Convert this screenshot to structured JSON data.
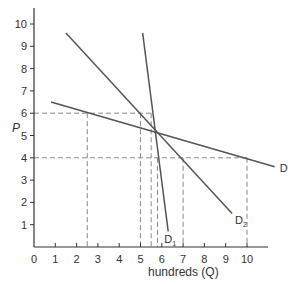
{
  "chart_data": {
    "type": "line",
    "title": "",
    "xlabel": "hundreds (Q)",
    "ylabel": "P",
    "xlim": [
      0,
      11
    ],
    "ylim": [
      0,
      11
    ],
    "x_ticks": [
      "0",
      "1",
      "2",
      "3",
      "4",
      "5",
      "6",
      "7",
      "8",
      "9",
      "10"
    ],
    "y_ticks": [
      "1",
      "2",
      "3",
      "4",
      "5",
      "6",
      "7",
      "8",
      "9",
      "10"
    ],
    "grid": false,
    "legend": "inline labels at line ends",
    "series": [
      {
        "name": "D1",
        "label": "D",
        "sub": "1",
        "points": [
          [
            5.1,
            9.6
          ],
          [
            6.3,
            0.7
          ]
        ]
      },
      {
        "name": "D2",
        "label": "D",
        "sub": "2",
        "points": [
          [
            1.5,
            9.6
          ],
          [
            9.3,
            1.5
          ]
        ]
      },
      {
        "name": "D3",
        "label": "D",
        "sub": "3",
        "points": [
          [
            0.8,
            6.5
          ],
          [
            11.3,
            3.6
          ]
        ]
      }
    ],
    "reference_lines": {
      "horizontal": [
        {
          "y": 6,
          "x_from": 0,
          "x_to": 5.6
        },
        {
          "y": 4,
          "x_from": 0,
          "x_to": 10
        }
      ],
      "vertical": [
        {
          "x": 2.5,
          "y_to": 6
        },
        {
          "x": 5.0,
          "y_to": 6
        },
        {
          "x": 5.5,
          "y_to": 6
        },
        {
          "x": 5.8,
          "y_to": 4
        },
        {
          "x": 7.0,
          "y_to": 4
        },
        {
          "x": 10.0,
          "y_to": 4
        }
      ]
    },
    "colors": {
      "curve": "#555555",
      "axis": "#333333",
      "dash": "#888888"
    }
  }
}
